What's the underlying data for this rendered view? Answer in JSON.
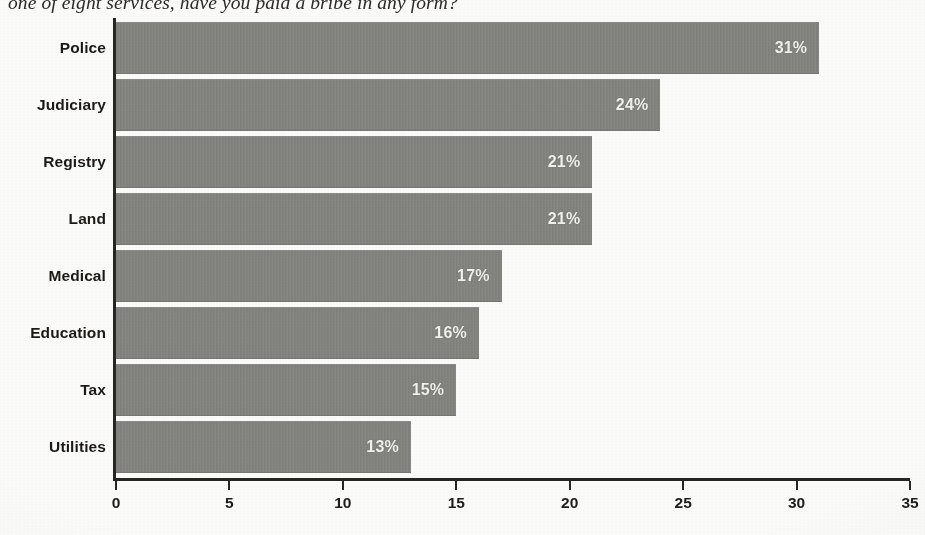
{
  "title": {
    "text": "one of eight services, have you paid a bribe in any form?",
    "clipped": true
  },
  "chart_data": {
    "type": "bar",
    "orientation": "horizontal",
    "title": "one of eight services, have you paid a bribe in any form?",
    "categories": [
      "Police",
      "Judiciary",
      "Registry",
      "Land",
      "Medical",
      "Education",
      "Tax",
      "Utilities"
    ],
    "values": [
      31,
      24,
      21,
      21,
      17,
      16,
      15,
      13
    ],
    "data_labels": [
      "31%",
      "24%",
      "21%",
      "21%",
      "17%",
      "16%",
      "15%",
      "13%"
    ],
    "xlabel": "",
    "ylabel": "",
    "xlim": [
      0,
      35
    ],
    "xticks": [
      0,
      5,
      10,
      15,
      20,
      25,
      30,
      35
    ],
    "xtick_labels": [
      "0",
      "5",
      "10",
      "15",
      "20",
      "25",
      "30",
      "35"
    ],
    "grid": false,
    "legend": false,
    "bar_color": "#848480",
    "label_color": "#f2f2ef",
    "axis_color": "#26251f",
    "background_color": "#fbfbf9"
  }
}
